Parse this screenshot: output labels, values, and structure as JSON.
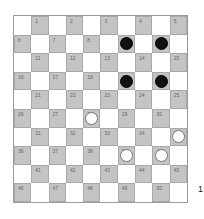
{
  "board": {
    "size": 10,
    "colors": {
      "light": "#ffffff",
      "dark": "#c4c4c4",
      "black_piece": "#111111",
      "white_piece": "#ffffff"
    },
    "pieces": {
      "black": [
        9,
        10,
        19,
        20
      ],
      "white": [
        28,
        35,
        39,
        40
      ]
    }
  },
  "side_label": "1"
}
